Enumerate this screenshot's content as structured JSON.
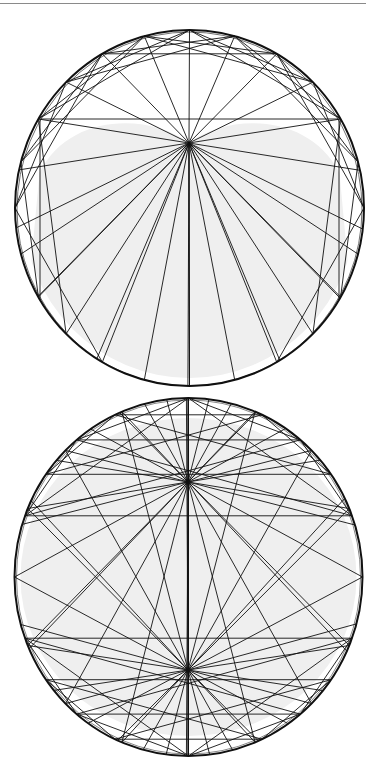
{
  "page": {
    "background": "#ffffff",
    "rule_color": "#8a8a8a"
  },
  "style": {
    "stroke": "#111111",
    "fill_shaded": "#efefef",
    "outline_width": 2,
    "chord_width": 0.9
  },
  "figures": [
    {
      "id": "top",
      "label": "caustic-single-focus",
      "cx": 189.5,
      "cy": 208,
      "rx": 174.5,
      "ry": 178,
      "shaded_region": "cardioid",
      "focus": [
        189,
        143
      ],
      "fan_points_deg": [
        -60,
        -75,
        -90,
        -105,
        -120,
        -135,
        -150,
        -165,
        180,
        165,
        150,
        135,
        120,
        105,
        90,
        75,
        60,
        45,
        30,
        15,
        0,
        -15,
        -30,
        -45
      ],
      "extra_lines": [
        {
          "x1": 40,
          "y1": 119,
          "x2": 339,
          "y2": 119
        },
        {
          "x1": 40,
          "y1": 119,
          "x2": 40,
          "y2": 300
        },
        {
          "x1": 339,
          "y1": 119,
          "x2": 339,
          "y2": 300
        }
      ]
    },
    {
      "id": "bottom",
      "label": "caustic-double-focus",
      "cx": 188.5,
      "cy": 577,
      "rx": 174,
      "ry": 179,
      "shaded_region": "interior",
      "focus": [
        188,
        482
      ],
      "focus2": [
        188,
        670
      ]
    }
  ]
}
